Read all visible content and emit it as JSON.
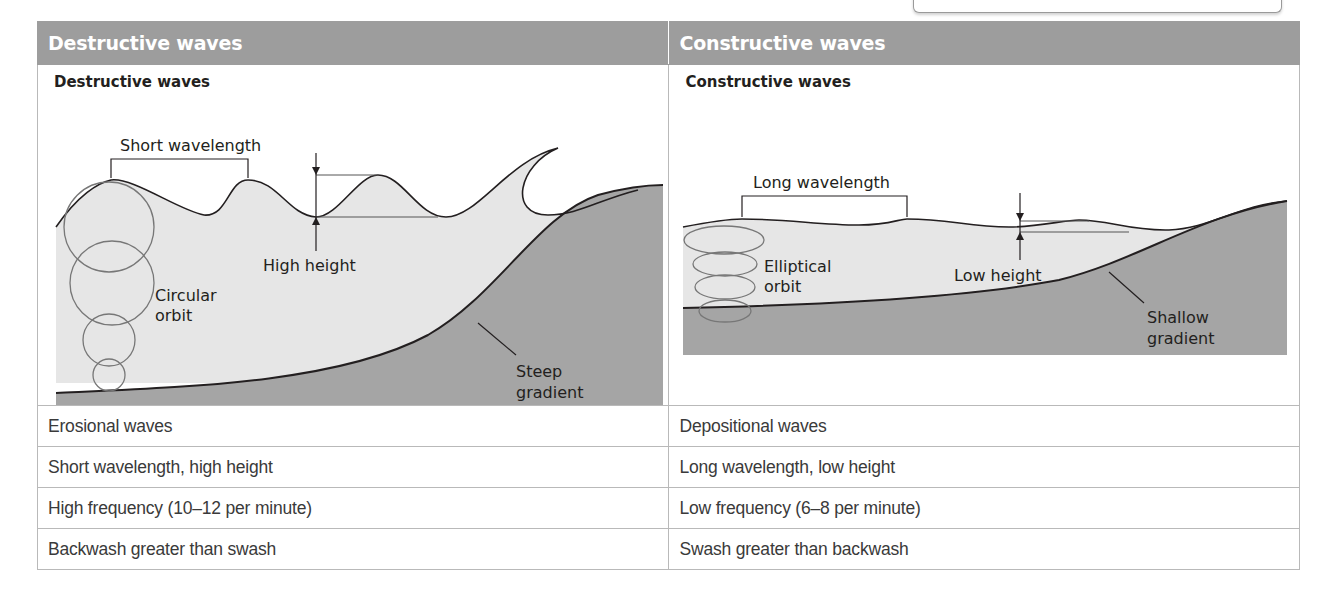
{
  "columns": [
    {
      "header": "Destructive waves",
      "diagram": {
        "title": "Destructive waves",
        "labels": {
          "wavelength": "Short wavelength",
          "height": "High height",
          "orbit_line1": "Circular",
          "orbit_line2": "orbit",
          "gradient_line1": "Steep",
          "gradient_line2": "gradient"
        }
      },
      "rows": [
        "Erosional waves",
        "Short wavelength, high height",
        "High frequency (10–12 per minute)",
        "Backwash greater than swash"
      ]
    },
    {
      "header": "Constructive waves",
      "diagram": {
        "title": "Constructive waves",
        "labels": {
          "wavelength": "Long wavelength",
          "height": "Low height",
          "orbit_line1": "Elliptical",
          "orbit_line2": "orbit",
          "gradient_line1": "Shallow",
          "gradient_line2": "gradient"
        }
      },
      "rows": [
        "Depositional waves",
        "Long wavelength, low height",
        "Low frequency (6–8 per minute)",
        "Swash greater than backwash"
      ]
    }
  ],
  "colors": {
    "header_bg": "#9d9d9d",
    "water": "#e4e4e4",
    "seabed": "#a3a3a3"
  }
}
